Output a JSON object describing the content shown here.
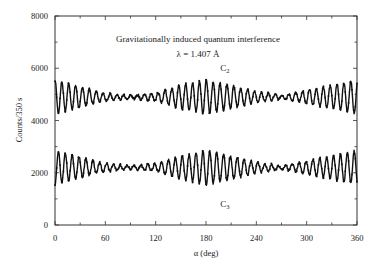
{
  "chart_data": {
    "type": "line",
    "title": "Gravitationally induced quantum interference",
    "subtitle": "λ = 1.407 Å",
    "xlabel": "α (deg)",
    "ylabel": "Counts/350 s",
    "xlim": [
      0,
      360
    ],
    "ylim": [
      0,
      8000
    ],
    "xticks": [
      0,
      60,
      120,
      180,
      240,
      300,
      360
    ],
    "xtick_labels": [
      "0",
      "60",
      "120",
      "180",
      "240",
      "300",
      "360"
    ],
    "yticks": [
      0,
      2000,
      4000,
      6000,
      8000
    ],
    "ytick_labels": [
      "0",
      "2000",
      "4000",
      "6000",
      "8000"
    ],
    "grid": false,
    "legend": "none (inline curve labels)",
    "series": [
      {
        "name": "C2",
        "label_position": {
          "x_deg": 197,
          "y_counts": 5900
        },
        "mean": 4900,
        "max_amplitude": 650,
        "phase_deg": 0,
        "fringe_period_deg": 8.2,
        "approx_envelope": [
          {
            "x": 0,
            "amp": 650
          },
          {
            "x": 30,
            "amp": 400
          },
          {
            "x": 60,
            "amp": 150
          },
          {
            "x": 90,
            "amp": 60
          },
          {
            "x": 120,
            "amp": 150
          },
          {
            "x": 150,
            "amp": 450
          },
          {
            "x": 180,
            "amp": 650
          },
          {
            "x": 210,
            "amp": 450
          },
          {
            "x": 240,
            "amp": 200
          },
          {
            "x": 270,
            "amp": 60
          },
          {
            "x": 300,
            "amp": 250
          },
          {
            "x": 330,
            "amp": 450
          },
          {
            "x": 360,
            "amp": 650
          }
        ],
        "range_observed": [
          4400,
          6100
        ]
      },
      {
        "name": "C3",
        "label_position": {
          "x_deg": 197,
          "y_counts": 700
        },
        "mean": 2200,
        "max_amplitude": 650,
        "phase_deg": 180,
        "fringe_period_deg": 8.2,
        "approx_envelope": [
          {
            "x": 0,
            "amp": 650
          },
          {
            "x": 30,
            "amp": 400
          },
          {
            "x": 60,
            "amp": 150
          },
          {
            "x": 90,
            "amp": 60
          },
          {
            "x": 120,
            "amp": 150
          },
          {
            "x": 150,
            "amp": 450
          },
          {
            "x": 180,
            "amp": 650
          },
          {
            "x": 210,
            "amp": 450
          },
          {
            "x": 240,
            "amp": 200
          },
          {
            "x": 270,
            "amp": 60
          },
          {
            "x": 300,
            "amp": 250
          },
          {
            "x": 330,
            "amp": 450
          },
          {
            "x": 360,
            "amp": 650
          }
        ],
        "range_observed": [
          1000,
          2700
        ]
      }
    ]
  }
}
